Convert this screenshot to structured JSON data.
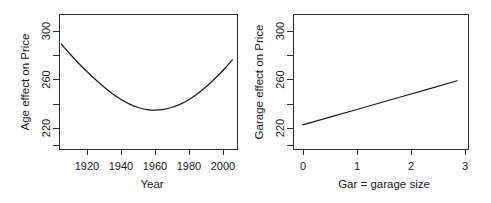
{
  "figure": {
    "background_color": "#ffffff",
    "line_color": "#1a1a1a",
    "axis_color": "#2b2b2b",
    "panel_count": 2
  },
  "chart_data": [
    {
      "type": "line",
      "panel": "left",
      "title": "",
      "xlabel": "Year",
      "ylabel": "Age effect on Price",
      "xlim": [
        1904,
        2008
      ],
      "ylim": [
        208,
        318
      ],
      "xticks": [
        1920,
        1940,
        1960,
        1980,
        2000
      ],
      "xtick_labels": [
        "1920",
        "1940",
        "1960",
        "1980",
        "2000"
      ],
      "yticks": [
        220,
        260,
        300
      ],
      "ytick_labels": [
        "220",
        "260",
        "300"
      ],
      "yticks_minor": [
        240,
        280
      ],
      "grid": false,
      "legend": false,
      "curve_shape": "parabolic-u",
      "x": [
        1905,
        1910,
        1915,
        1920,
        1925,
        1930,
        1935,
        1940,
        1945,
        1950,
        1955,
        1960,
        1965,
        1970,
        1975,
        1980,
        1985,
        1990,
        1995,
        2000,
        2005
      ],
      "values": [
        294.0,
        286.0,
        278.5,
        271.5,
        265.0,
        259.0,
        253.5,
        248.8,
        245.0,
        242.2,
        240.5,
        240.0,
        240.6,
        242.4,
        245.2,
        249.0,
        253.8,
        259.5,
        266.0,
        273.2,
        281.0
      ]
    },
    {
      "type": "line",
      "panel": "right",
      "title": "",
      "xlabel": "Gar = garage size",
      "ylabel": "Garage effect on Price",
      "xlim": [
        -0.18,
        3.22
      ],
      "ylim": [
        208,
        318
      ],
      "xticks": [
        0,
        1,
        2,
        3
      ],
      "xtick_labels": [
        "0",
        "1",
        "2",
        "3"
      ],
      "yticks": [
        220,
        260,
        300
      ],
      "ytick_labels": [
        "220",
        "260",
        "300"
      ],
      "yticks_minor": [
        240,
        280
      ],
      "grid": false,
      "legend": false,
      "curve_shape": "linear-increasing",
      "x": [
        0,
        1,
        2,
        3
      ],
      "values": [
        228.0,
        240.0,
        252.0,
        264.0
      ]
    }
  ]
}
